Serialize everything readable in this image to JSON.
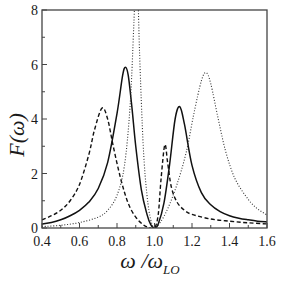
{
  "chart_data": {
    "type": "line",
    "title": "",
    "xlabel": "ω/ω_LO",
    "xlabel_main": "ω /ω",
    "xlabel_sub": "LO",
    "ylabel": "F(ω)",
    "xlim": [
      0.4,
      1.6
    ],
    "ylim": [
      0,
      8
    ],
    "xticks": [
      0.4,
      0.6,
      0.8,
      1.0,
      1.2,
      1.4,
      1.6
    ],
    "xtick_labels": [
      "0.4",
      "0.6",
      "0.8",
      "1.0",
      "1.2",
      "1.4",
      "1.6"
    ],
    "yticks": [
      0,
      2,
      4,
      6,
      8
    ],
    "ytick_labels": [
      "0",
      "2",
      "4",
      "6",
      "8"
    ],
    "grid": false,
    "legend": null,
    "series": [
      {
        "name": "solid",
        "style": "solid",
        "color": "#111111",
        "x": [
          0.4,
          0.45,
          0.5,
          0.55,
          0.6,
          0.65,
          0.7,
          0.75,
          0.8,
          0.83,
          0.845,
          0.86,
          0.88,
          0.9,
          0.93,
          0.96,
          0.98,
          1.0,
          1.02,
          1.05,
          1.08,
          1.11,
          1.135,
          1.16,
          1.2,
          1.25,
          1.3,
          1.35,
          1.4,
          1.45,
          1.5,
          1.55,
          1.6
        ],
        "y": [
          0.15,
          0.2,
          0.3,
          0.45,
          0.65,
          0.95,
          1.45,
          2.4,
          4.2,
          5.6,
          5.9,
          5.6,
          4.4,
          3.0,
          1.4,
          0.5,
          0.12,
          0.0,
          0.15,
          0.9,
          2.3,
          4.0,
          4.45,
          3.8,
          2.3,
          1.3,
          0.85,
          0.6,
          0.45,
          0.36,
          0.3,
          0.25,
          0.22
        ]
      },
      {
        "name": "dashed",
        "style": "dashed",
        "color": "#111111",
        "x": [
          0.4,
          0.45,
          0.5,
          0.55,
          0.6,
          0.65,
          0.68,
          0.72,
          0.75,
          0.78,
          0.82,
          0.86,
          0.9,
          0.94,
          0.97,
          1.0,
          1.02,
          1.035,
          1.055,
          1.07,
          1.09,
          1.12,
          1.16,
          1.2,
          1.3,
          1.4,
          1.5,
          1.6
        ],
        "y": [
          0.3,
          0.45,
          0.65,
          1.0,
          1.6,
          2.7,
          3.6,
          4.4,
          4.0,
          3.0,
          1.8,
          0.9,
          0.4,
          0.12,
          0.02,
          0.0,
          0.5,
          1.8,
          3.05,
          2.4,
          1.5,
          0.95,
          0.65,
          0.5,
          0.33,
          0.25,
          0.19,
          0.15
        ]
      },
      {
        "name": "dotted",
        "style": "dotted",
        "color": "#333333",
        "x": [
          0.4,
          0.5,
          0.6,
          0.7,
          0.75,
          0.8,
          0.84,
          0.87,
          0.89,
          0.905,
          0.92,
          0.94,
          0.96,
          0.98,
          1.0,
          1.03,
          1.07,
          1.12,
          1.17,
          1.21,
          1.25,
          1.275,
          1.3,
          1.34,
          1.38,
          1.43,
          1.5,
          1.55,
          1.6
        ],
        "y": [
          0.05,
          0.1,
          0.2,
          0.4,
          0.65,
          1.2,
          2.3,
          4.5,
          7.5,
          10.0,
          6.5,
          3.0,
          1.2,
          0.3,
          0.0,
          0.2,
          0.7,
          1.6,
          2.8,
          4.2,
          5.4,
          5.7,
          5.3,
          4.0,
          2.8,
          1.8,
          1.05,
          0.7,
          0.48
        ]
      }
    ]
  },
  "layout": {
    "plot_left": 42,
    "plot_right": 267,
    "plot_top": 10,
    "plot_bottom": 228
  }
}
